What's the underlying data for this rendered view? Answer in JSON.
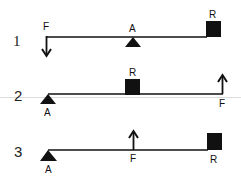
{
  "diagram": {
    "type": "lever classes",
    "levers": [
      {
        "number": "1",
        "labels": {
          "force": "F",
          "fulcrum": "A",
          "resistance": "R"
        },
        "order": "F - A - R",
        "force_direction": "down"
      },
      {
        "number": "2",
        "labels": {
          "fulcrum": "A",
          "resistance": "R",
          "force": "F"
        },
        "order": "A - R - F",
        "force_direction": "up"
      },
      {
        "number": "3",
        "labels": {
          "fulcrum": "A",
          "force": "F",
          "resistance": "R"
        },
        "order": "A - F - R",
        "force_direction": "up"
      }
    ],
    "colors": {
      "ink": "#111111",
      "background": "#ffffff",
      "guide_line": "#d8d8d8"
    }
  }
}
